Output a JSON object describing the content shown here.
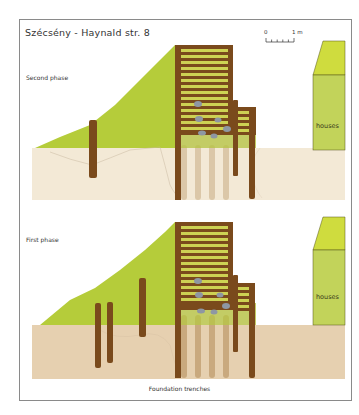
{
  "title": "Szécsény - Haynald str. 8",
  "scale_bar": {
    "start_label": "0",
    "end_label": "1 m",
    "divisions": 5
  },
  "panels": [
    {
      "id": "second-phase",
      "label": "Second phase",
      "house_label": "houses"
    },
    {
      "id": "first-phase",
      "label": "First phase",
      "house_label": "houses"
    }
  ],
  "caption": "Foundation trenches",
  "colors": {
    "hill": "#b5cc3a",
    "ground_top": "#f3e9d6",
    "ground_bottom": "#e6d0b0",
    "timber": "#7a4a1c",
    "infill": "#c8cf52",
    "house": "#c2d35a",
    "house_roof": "#cfdc3e",
    "trench": "#c9a97e",
    "stone": "#8e97a3",
    "frame": "#8a8a8a"
  }
}
